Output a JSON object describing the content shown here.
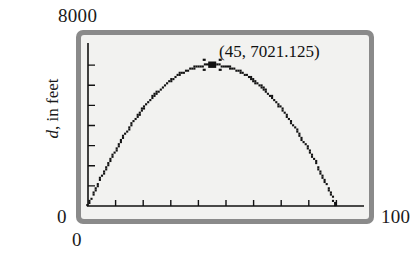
{
  "figure": {
    "kind": "graphing-calculator-plot",
    "colors": {
      "bezel": "#8a8a8a",
      "screen": "#f2f2f0",
      "ink": "#111111",
      "page": "#ffffff"
    }
  },
  "labels": {
    "y_max": "8000",
    "y_zero": "0",
    "x_zero": "0",
    "x_max": "100",
    "y_axis_title_italic": "d",
    "y_axis_title_rest": ", in feet"
  },
  "annotation": {
    "point_text": "(45, 7021.125)"
  },
  "chart_data": {
    "type": "line",
    "title": "",
    "subtitle": "",
    "xlabel": "",
    "ylabel": "d, in feet",
    "xlim": [
      0,
      100
    ],
    "ylim": [
      0,
      8000
    ],
    "grid": false,
    "legend": "none",
    "x_tick_labels": [
      "0",
      "100"
    ],
    "y_tick_labels": [
      "0",
      "8000"
    ],
    "x_tick_count": 9,
    "y_tick_count": 7,
    "x_tick_step": 10,
    "y_tick_step": 1000,
    "curve_style": "dotted-pixel-trace",
    "marker": {
      "style": "bold-cross",
      "x": 45,
      "y": 7021.125,
      "label": "(45, 7021.125)"
    },
    "series": [
      {
        "name": "d",
        "equation": "d = -3.4672(x - 45)^2 + 7021.125",
        "x": [
          0,
          3,
          6,
          9,
          12,
          15,
          18,
          21,
          24,
          27,
          30,
          33,
          36,
          39,
          42,
          45,
          48,
          51,
          54,
          57,
          60,
          63,
          66,
          69,
          72,
          75,
          78,
          81,
          84,
          87,
          90
        ],
        "values": [
          0,
          561,
          1075,
          1543,
          1963,
          2337,
          2664,
          2944,
          3178,
          3365,
          3505,
          3599,
          3646,
          3646,
          3599,
          3505,
          3365,
          3178,
          2944,
          2664,
          2337,
          1963,
          1543,
          1075,
          561,
          0,
          0,
          0,
          0,
          0,
          0
        ]
      }
    ],
    "curve_points_xy": [
      [
        0,
        0
      ],
      [
        5,
        1419
      ],
      [
        10,
        2665
      ],
      [
        15,
        3738
      ],
      [
        20,
        4637
      ],
      [
        25,
        5363
      ],
      [
        30,
        5916
      ],
      [
        35,
        6295
      ],
      [
        40,
        6501
      ],
      [
        45,
        7021.125
      ],
      [
        50,
        6501
      ],
      [
        55,
        6295
      ],
      [
        60,
        5916
      ],
      [
        65,
        5363
      ],
      [
        70,
        4637
      ],
      [
        75,
        3738
      ],
      [
        80,
        2665
      ],
      [
        85,
        1419
      ],
      [
        90,
        0
      ]
    ],
    "roots": [
      0,
      90
    ],
    "vertex": [
      45,
      7021.125
    ]
  }
}
